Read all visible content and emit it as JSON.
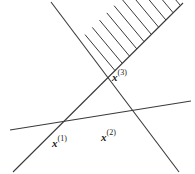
{
  "figure": {
    "type": "geometry-diagram",
    "width": 195,
    "height": 174,
    "background_color": "#ffffff",
    "line_color": "#3a3a3a",
    "label_color": "#1a1a1a",
    "labels": [
      {
        "id": "x1",
        "base": "x",
        "superscript": "(1)",
        "x": 52,
        "y": 136
      },
      {
        "id": "x2",
        "base": "x",
        "superscript": "(2)",
        "x": 101,
        "y": 130
      },
      {
        "id": "x3",
        "base": "x",
        "superscript": "(3)",
        "x": 112,
        "y": 70
      }
    ],
    "lines": [
      {
        "id": "line-ascending",
        "x1": 13,
        "y1": 172,
        "x2": 183,
        "y2": 3
      },
      {
        "id": "line-descending",
        "x1": 51,
        "y1": 2,
        "x2": 179,
        "y2": 172
      },
      {
        "id": "line-shallow",
        "x1": 10,
        "y1": 130,
        "x2": 191,
        "y2": 101
      }
    ],
    "vertices": [
      {
        "id": "vertex-x1",
        "x": 60,
        "y": 127
      },
      {
        "id": "vertex-x2",
        "x": 125,
        "y": 118
      },
      {
        "id": "vertex-x3",
        "x": 103,
        "y": 72
      }
    ],
    "hatching": {
      "on_line": "line-ascending",
      "side": "upper-left",
      "count": 10,
      "length": 47,
      "dx": -30,
      "dy": 36,
      "start_t": 0.6,
      "end_t": 0.985
    }
  }
}
